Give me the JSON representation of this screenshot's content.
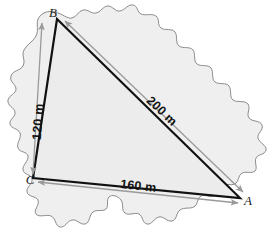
{
  "figure": {
    "vertices": [
      {
        "id": "A",
        "label": "A",
        "x": 240,
        "y": 198
      },
      {
        "id": "B",
        "label": "B",
        "x": 57,
        "y": 19
      },
      {
        "id": "C",
        "label": "C",
        "x": 33,
        "y": 178
      }
    ],
    "dimensions": [
      {
        "id": "side-bc",
        "label": "120 m",
        "value": 120,
        "unit": "m",
        "from": "C",
        "to": "B"
      },
      {
        "id": "side-ba",
        "label": "200 m",
        "value": 200,
        "unit": "m",
        "from": "A",
        "to": "B"
      },
      {
        "id": "side-ca",
        "label": "160 m",
        "value": 160,
        "unit": "m",
        "from": "C",
        "to": "A"
      }
    ],
    "colors": {
      "triangle_stroke": "#111111",
      "parcel_fill": "#efefef",
      "parcel_stroke": "#8a8a8a",
      "dimension_line": "#9a9a9a",
      "label_text": "#141414"
    }
  }
}
